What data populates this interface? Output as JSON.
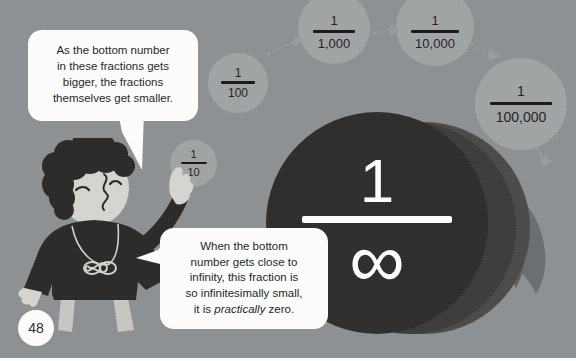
{
  "page": {
    "number": "48",
    "background_color": "#8e9193",
    "ink_color": "#231f20",
    "circle_color": "#a2a5a6",
    "dark_color": "#2e2c2b",
    "bubble_color": "#ffffff"
  },
  "speech_bubbles": [
    {
      "id": "bubble-top-left",
      "lines": [
        "As the bottom number",
        "in these fractions gets",
        "bigger, the fractions",
        "themselves get smaller."
      ],
      "text": "As the bottom number in these fractions gets bigger, the fractions themselves get smaller."
    },
    {
      "id": "bubble-bottom",
      "lines": [
        "When the bottom",
        "number gets close to",
        "infinity, this fraction is",
        "so infinitesimally small,",
        "it is practically zero."
      ],
      "emphasis_word": "practically",
      "text": "When the bottom number gets close to infinity, this fraction is so infinitesimally small, it is practically zero."
    }
  ],
  "fractions": [
    {
      "id": "fraction-1-10",
      "numerator": "1",
      "denominator": "10"
    },
    {
      "id": "fraction-1-100",
      "numerator": "1",
      "denominator": "100"
    },
    {
      "id": "fraction-1-1000",
      "numerator": "1",
      "denominator": "1,000"
    },
    {
      "id": "fraction-1-10000",
      "numerator": "1",
      "denominator": "10,000"
    },
    {
      "id": "fraction-1-100000",
      "numerator": "1",
      "denominator": "100,000"
    },
    {
      "id": "fraction-1-infinity",
      "numerator": "1",
      "denominator": "∞"
    }
  ],
  "character": {
    "name": "mathematician-character",
    "necklace_pendant": "∞"
  }
}
